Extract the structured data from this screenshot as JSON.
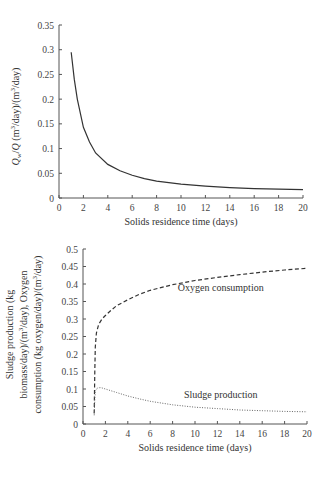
{
  "chart_data": [
    {
      "type": "line",
      "title": "",
      "xlabel": "Solids residence time (days)",
      "ylabel_parts": [
        "Q",
        "w",
        "/Q (m",
        "3",
        "/day)/(m",
        "3",
        "/day)"
      ],
      "ylabel": "Qw/Q (m3/day)/(m3/day)",
      "xlim": [
        0,
        20
      ],
      "ylim": [
        0,
        0.35
      ],
      "xticks": [
        "0",
        "2",
        "4",
        "6",
        "8",
        "10",
        "12",
        "14",
        "16",
        "18",
        "20"
      ],
      "yticks": [
        "0",
        "0.05",
        "0.1",
        "0.15",
        "0.2",
        "0.25",
        "0.3",
        "0.35"
      ],
      "grid": false,
      "series": [
        {
          "name": "Qw/Q",
          "style": "solid",
          "x": [
            1,
            1.25,
            1.5,
            2,
            2.5,
            3,
            4,
            5,
            6,
            7,
            8,
            10,
            12,
            14,
            16,
            18,
            20
          ],
          "y": [
            0.295,
            0.24,
            0.2,
            0.143,
            0.113,
            0.091,
            0.068,
            0.055,
            0.046,
            0.039,
            0.034,
            0.028,
            0.024,
            0.021,
            0.019,
            0.018,
            0.017
          ]
        }
      ]
    },
    {
      "type": "line",
      "title": "",
      "xlabel": "Solids residence time (days)",
      "ylabel_lines": [
        "Sludge production (kg",
        "biomass/day)/(m3/day), Oxygen",
        "consumption (kg oxygen/day)/(m3/day)"
      ],
      "ylabel": "Sludge production (kg biomass/day)/(m3/day), Oxygen consumption (kg oxygen/day)/(m3/day)",
      "xlim": [
        0,
        20
      ],
      "ylim": [
        0,
        0.5
      ],
      "xticks": [
        "0",
        "2",
        "4",
        "6",
        "8",
        "10",
        "12",
        "14",
        "16",
        "18",
        "20"
      ],
      "yticks": [
        "0",
        "0.05",
        "0.1",
        "0.15",
        "0.2",
        "0.25",
        "0.3",
        "0.35",
        "0.4",
        "0.45",
        "0.5"
      ],
      "grid": false,
      "series": [
        {
          "name": "Oxygen consumption",
          "style": "dashed",
          "x": [
            1,
            1.05,
            1.1,
            1.2,
            1.4,
            1.7,
            2,
            2.5,
            3,
            4,
            5,
            6,
            8,
            10,
            12,
            14,
            16,
            18,
            20
          ],
          "y": [
            0.03,
            0.15,
            0.22,
            0.26,
            0.285,
            0.3,
            0.31,
            0.325,
            0.338,
            0.355,
            0.37,
            0.382,
            0.398,
            0.41,
            0.419,
            0.427,
            0.434,
            0.44,
            0.445
          ]
        },
        {
          "name": "Sludge production",
          "style": "dotted",
          "x": [
            1,
            1.05,
            1.1,
            1.3,
            1.6,
            2,
            3,
            4,
            5,
            6,
            8,
            10,
            12,
            14,
            16,
            18,
            20
          ],
          "y": [
            0.025,
            0.07,
            0.095,
            0.103,
            0.104,
            0.1,
            0.09,
            0.08,
            0.072,
            0.065,
            0.055,
            0.048,
            0.044,
            0.04,
            0.038,
            0.036,
            0.035
          ]
        }
      ],
      "annotations": [
        {
          "text": "Oxygen consumption",
          "x": 12.3,
          "y": 0.38
        },
        {
          "text": "Sludge production",
          "x": 12.3,
          "y": 0.075
        }
      ]
    }
  ]
}
